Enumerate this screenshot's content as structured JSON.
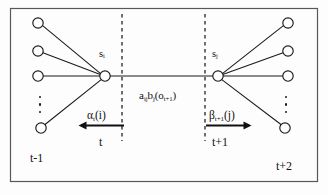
{
  "figure": {
    "name": "hmm-forward-backward-trellis",
    "border_color": "#58585a",
    "background_color": "#fdfdfd",
    "stroke_color": "#1a1a1a",
    "node_fill": "#ffffff",
    "width": 328,
    "height": 195
  },
  "states": {
    "left_hub_label": "s",
    "left_hub_sub": "i",
    "right_hub_label": "s",
    "right_hub_sub": "j"
  },
  "transition": {
    "a_symbol": "a",
    "a_sub": "ij",
    "b_symbol": "b",
    "b_sub": "j",
    "obs_open": "(o",
    "obs_sub": "t+1",
    "obs_close": ")"
  },
  "forward": {
    "symbol": "α",
    "sub": "t",
    "arg": "(i)",
    "arrow_direction": "left",
    "time_label": "t"
  },
  "backward": {
    "symbol": "β",
    "sub": "t+1",
    "arg": "(j)",
    "arrow_direction": "right",
    "time_label": "t+1"
  },
  "time_axis": {
    "left_outer": "t-1",
    "right_outer": "t+2"
  },
  "nodes": {
    "left_hub": {
      "cx": 105,
      "cy": 76,
      "r": 5.2
    },
    "right_hub": {
      "cx": 218,
      "cy": 76,
      "r": 5.2
    },
    "left_fan": [
      {
        "cx": 38,
        "cy": 23,
        "r": 5.2
      },
      {
        "cx": 38,
        "cy": 51,
        "r": 5.2
      },
      {
        "cx": 38,
        "cy": 76,
        "r": 5.2
      },
      {
        "cx": 41,
        "cy": 128,
        "r": 5.2
      }
    ],
    "right_fan": [
      {
        "cx": 288,
        "cy": 23,
        "r": 5.2
      },
      {
        "cx": 288,
        "cy": 51,
        "r": 5.2
      },
      {
        "cx": 288,
        "cy": 76,
        "r": 5.2
      },
      {
        "cx": 285,
        "cy": 128,
        "r": 5.2
      }
    ]
  },
  "divider_lines": {
    "left_x": 122,
    "right_x": 205,
    "y_top": 14,
    "y_bottom": 141,
    "dash": "3.5 3.5"
  },
  "ellipsis": {
    "left_x": 40,
    "right_x": 286,
    "y": 96,
    "dot_count": 3
  }
}
